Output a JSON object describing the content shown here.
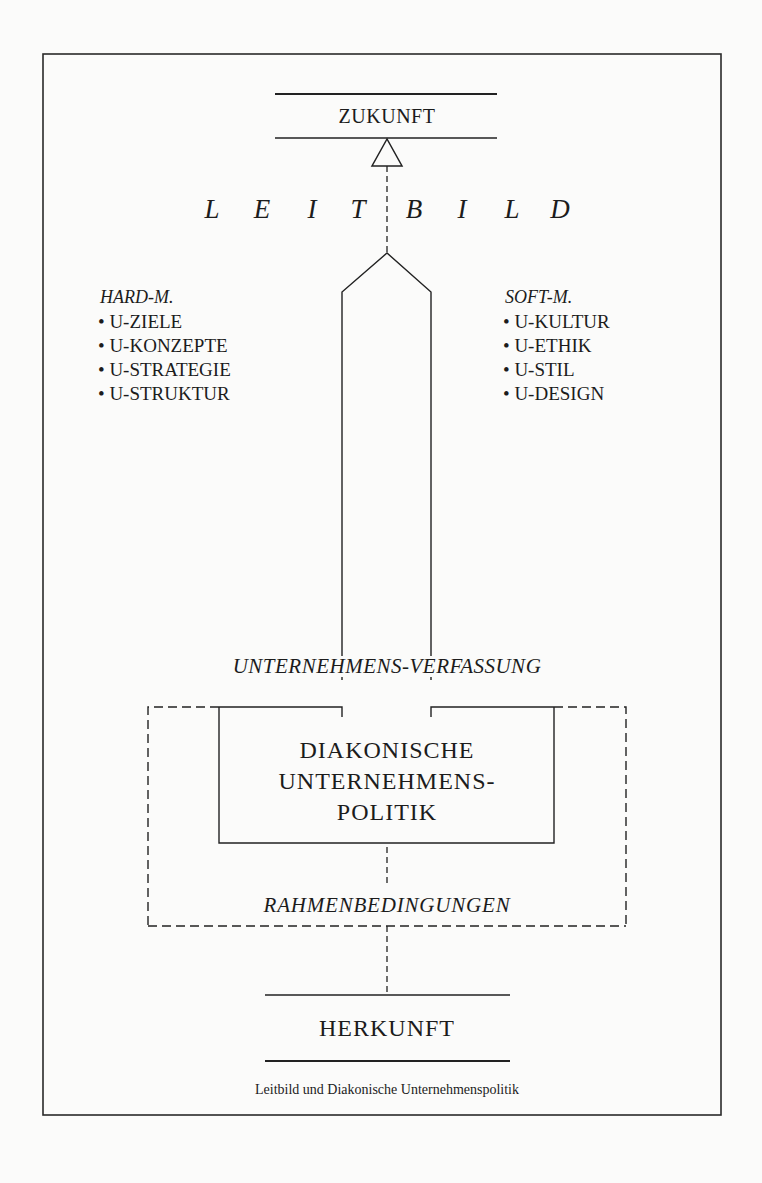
{
  "diagram": {
    "caption": "Leitbild und Diakonische Unternehmenspolitik",
    "top_node": {
      "label": "ZUKUNFT"
    },
    "leitbild": {
      "label": "LEITBILD",
      "letters": [
        "L",
        "E",
        "I",
        "T",
        "B",
        "I",
        "L",
        "D"
      ]
    },
    "hard_m": {
      "heading": "HARD-M.",
      "items": [
        "• U-ZIELE",
        "• U-KONZEPTE",
        "• U-STRATEGIE",
        "• U-STRUKTUR"
      ]
    },
    "soft_m": {
      "heading": "SOFT-M.",
      "items": [
        "• U-KULTUR",
        "• U-ETHIK",
        "• U-STIL",
        "• U-DESIGN"
      ]
    },
    "verfassung": {
      "label": "UNTERNEHMENS-VERFASSUNG"
    },
    "core_box": {
      "lines": [
        "DIAKONISCHE",
        "UNTERNEHMENS-",
        "POLITIK"
      ]
    },
    "rahmen": {
      "label": "RAHMENBEDINGUNGEN"
    },
    "bottom_node": {
      "label": "HERKUNFT"
    },
    "colors": {
      "ink": "#1c1c1c",
      "paper": "#fbfbfa"
    }
  }
}
